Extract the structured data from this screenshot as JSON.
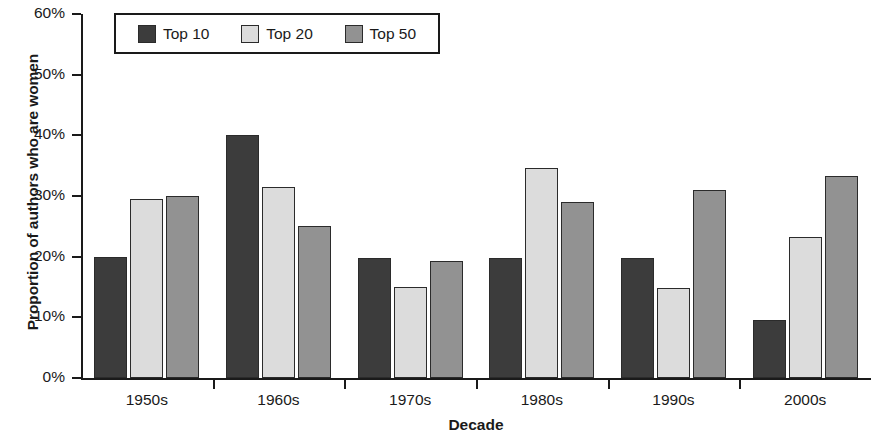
{
  "chart_data": {
    "type": "bar",
    "title": "",
    "xlabel": "Decade",
    "ylabel": "Proportion of authors who are women",
    "categories": [
      "1950s",
      "1960s",
      "1970s",
      "1980s",
      "1990s",
      "2000s"
    ],
    "series": [
      {
        "name": "Top 10",
        "color": "#3c3c3c",
        "values": [
          20.0,
          40.0,
          19.8,
          19.8,
          19.8,
          9.5
        ]
      },
      {
        "name": "Top 20",
        "color": "#dcdcdc",
        "values": [
          29.5,
          31.5,
          15.0,
          34.6,
          14.8,
          23.3
        ]
      },
      {
        "name": "Top 50",
        "color": "#929292",
        "values": [
          30.0,
          25.0,
          19.3,
          29.0,
          31.0,
          33.3
        ]
      }
    ],
    "ylim": [
      0,
      60
    ],
    "ytick_labels": [
      "0%",
      "10%",
      "20%",
      "30%",
      "40%",
      "50%",
      "60%"
    ],
    "ytick_values": [
      0,
      10,
      20,
      30,
      40,
      50,
      60
    ],
    "grid": false,
    "legend_position": "top-left"
  }
}
